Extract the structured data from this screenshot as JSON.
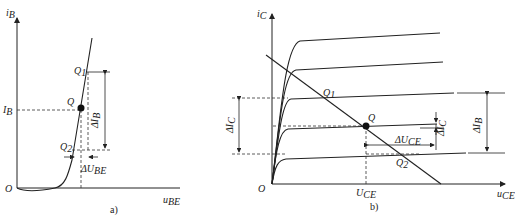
{
  "figure_a": {
    "caption": "a)",
    "y_axis": {
      "label": "i",
      "sub": "B"
    },
    "x_axis": {
      "label": "u",
      "sub": "BE"
    },
    "origin": "O",
    "point_q": "Q",
    "point_q1": {
      "label": "Q",
      "sub": "1"
    },
    "point_q2": {
      "label": "Q",
      "sub": "2"
    },
    "ib_label": {
      "label": "I",
      "sub": "B"
    },
    "delta_ib": {
      "label": "ΔI",
      "sub": "B"
    },
    "delta_ube": {
      "label": "ΔU",
      "sub": "BE"
    }
  },
  "figure_b": {
    "caption": "b)",
    "y_axis": {
      "label": "i",
      "sub": "C"
    },
    "x_axis": {
      "label": "u",
      "sub": "CE"
    },
    "origin": "O",
    "point_q": "Q",
    "point_q1": {
      "label": "Q",
      "sub": "1"
    },
    "point_q2": {
      "label": "Q",
      "sub": "2"
    },
    "uce_label": {
      "label": "U",
      "sub": "CE"
    },
    "delta_ic_left": {
      "label": "ΔI",
      "sub": "C"
    },
    "delta_ic_right": {
      "label": "ΔI",
      "sub": "C"
    },
    "delta_uce": {
      "label": "ΔU",
      "sub": "CE"
    },
    "delta_ib": {
      "label": "ΔI",
      "sub": "B"
    }
  }
}
